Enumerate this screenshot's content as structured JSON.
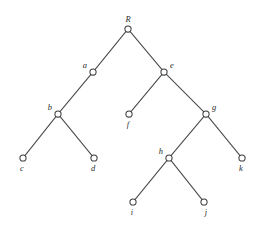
{
  "figure": {
    "type": "tree-diagram",
    "title": "",
    "width": 262,
    "height": 233,
    "background_color": "#ffffff",
    "edge_color": "#4a4a4a",
    "node_stroke_color": "#3d3d3d",
    "node_fill_color": "#ffffff",
    "label_color": "#2b2b2b",
    "node_radius": 3.1
  },
  "chart_data": {
    "type": "tree",
    "title": "",
    "root": "R",
    "nodes": [
      {
        "id": "R",
        "label": "R",
        "x": 128,
        "y": 29,
        "level": 0,
        "label_dx": 0,
        "label_dy": -9,
        "label_anchor": "middle"
      },
      {
        "id": "a",
        "label": "a",
        "x": 93,
        "y": 72,
        "level": 1,
        "label_dx": -6,
        "label_dy": -6,
        "label_anchor": "end"
      },
      {
        "id": "e",
        "label": "e",
        "x": 164,
        "y": 72,
        "level": 1,
        "label_dx": 6,
        "label_dy": -6,
        "label_anchor": "start"
      },
      {
        "id": "b",
        "label": "b",
        "x": 58,
        "y": 114,
        "level": 2,
        "label_dx": -6,
        "label_dy": -6,
        "label_anchor": "end"
      },
      {
        "id": "f",
        "label": "f",
        "x": 129,
        "y": 114,
        "level": 2,
        "label_dx": -1,
        "label_dy": 11,
        "label_anchor": "middle"
      },
      {
        "id": "g",
        "label": "g",
        "x": 206,
        "y": 114,
        "level": 2,
        "label_dx": 6,
        "label_dy": -6,
        "label_anchor": "start"
      },
      {
        "id": "c",
        "label": "c",
        "x": 23,
        "y": 158,
        "level": 3,
        "label_dx": -1,
        "label_dy": 11,
        "label_anchor": "middle"
      },
      {
        "id": "d",
        "label": "d",
        "x": 94,
        "y": 158,
        "level": 3,
        "label_dx": -1,
        "label_dy": 11,
        "label_anchor": "middle"
      },
      {
        "id": "h",
        "label": "h",
        "x": 169,
        "y": 158,
        "level": 3,
        "label_dx": -6,
        "label_dy": -6,
        "label_anchor": "end"
      },
      {
        "id": "k",
        "label": "k",
        "x": 242,
        "y": 158,
        "level": 3,
        "label_dx": -1,
        "label_dy": 11,
        "label_anchor": "middle"
      },
      {
        "id": "i",
        "label": "i",
        "x": 133,
        "y": 202,
        "level": 4,
        "label_dx": -1,
        "label_dy": 11,
        "label_anchor": "middle"
      },
      {
        "id": "j",
        "label": "j",
        "x": 204,
        "y": 202,
        "level": 4,
        "label_dx": 2,
        "label_dy": 11,
        "label_anchor": "middle"
      }
    ],
    "edges": [
      {
        "from": "R",
        "to": "a",
        "side": "left"
      },
      {
        "from": "R",
        "to": "e",
        "side": "right"
      },
      {
        "from": "a",
        "to": "b",
        "side": "left"
      },
      {
        "from": "b",
        "to": "c",
        "side": "left"
      },
      {
        "from": "b",
        "to": "d",
        "side": "right"
      },
      {
        "from": "e",
        "to": "f",
        "side": "left"
      },
      {
        "from": "e",
        "to": "g",
        "side": "right"
      },
      {
        "from": "g",
        "to": "h",
        "side": "left"
      },
      {
        "from": "g",
        "to": "k",
        "side": "right"
      },
      {
        "from": "h",
        "to": "i",
        "side": "left"
      },
      {
        "from": "h",
        "to": "j",
        "side": "right"
      }
    ]
  }
}
